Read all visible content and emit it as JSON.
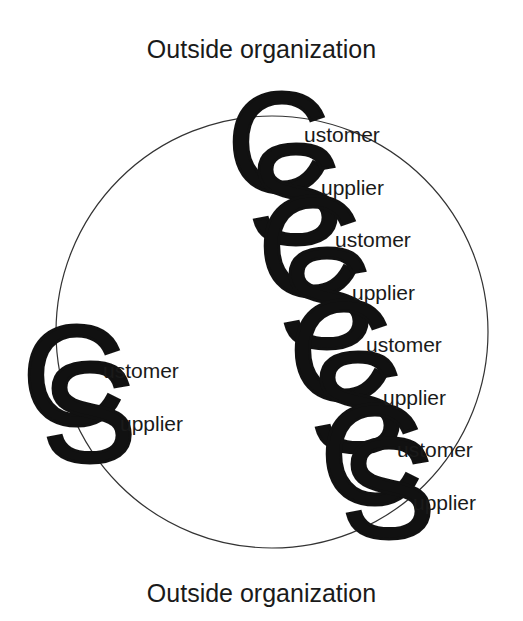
{
  "labels": {
    "top": "Outside organization",
    "bottom": "Outside organization"
  },
  "circle": {
    "cx": 272,
    "cy": 332,
    "r": 216,
    "stroke": "#333333"
  },
  "colors": {
    "letters": "#111111",
    "text": "#1a1a1a",
    "background": "#ffffff"
  },
  "left_pair": [
    {
      "letter": "C",
      "suffix": "ustomer",
      "role": "Customer"
    },
    {
      "letter": "S",
      "suffix": "upplier",
      "role": "Supplier"
    }
  ],
  "chain": [
    {
      "letter": "C",
      "suffix": "ustomer",
      "role": "Customer"
    },
    {
      "letter": "S",
      "suffix": "upplier",
      "role": "Supplier"
    },
    {
      "letter": "C",
      "suffix": "ustomer",
      "role": "Customer"
    },
    {
      "letter": "S",
      "suffix": "upplier",
      "role": "Supplier"
    },
    {
      "letter": "C",
      "suffix": "ustomer",
      "role": "Customer"
    },
    {
      "letter": "S",
      "suffix": "upplier",
      "role": "Supplier"
    },
    {
      "letter": "C",
      "suffix": "ustomer",
      "role": "Customer"
    },
    {
      "letter": "S",
      "suffix": "upplier",
      "role": "Supplier"
    }
  ]
}
